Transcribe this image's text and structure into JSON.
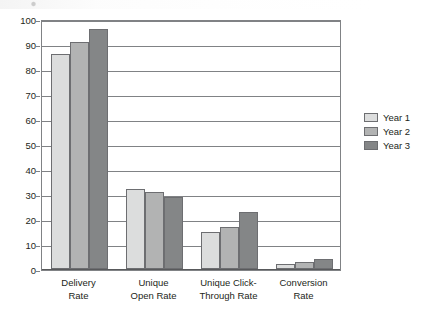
{
  "chart_data": {
    "type": "bar",
    "title": "",
    "xlabel": "",
    "ylabel": "",
    "ylim": [
      0,
      100
    ],
    "ytick_step": 10,
    "yticks": [
      "100",
      "90",
      "80",
      "70",
      "60",
      "50",
      "40",
      "30",
      "20",
      "10",
      "0"
    ],
    "grid": "horizontal",
    "legend_position": "right",
    "categories": [
      "Delivery Rate",
      "Unique Open Rate",
      "Unique Click-Through Rate",
      "Conversion Rate"
    ],
    "category_lines": [
      [
        "Delivery",
        "Rate"
      ],
      [
        "Unique",
        "Open Rate"
      ],
      [
        "Unique Click-",
        "Through Rate"
      ],
      [
        "Conversion",
        "Rate"
      ]
    ],
    "series": [
      {
        "name": "Year 1",
        "color": "#dcdddd",
        "values": [
          86,
          32,
          15,
          2
        ]
      },
      {
        "name": "Year 2",
        "color": "#b2b3b3",
        "values": [
          91,
          31,
          17,
          3
        ]
      },
      {
        "name": "Year 3",
        "color": "#848687",
        "values": [
          96,
          29,
          23,
          4
        ]
      }
    ]
  },
  "legend": {
    "items": [
      {
        "label": "Year 1",
        "color": "#dcdddd"
      },
      {
        "label": "Year 2",
        "color": "#b2b3b3"
      },
      {
        "label": "Year 3",
        "color": "#848687"
      }
    ]
  }
}
